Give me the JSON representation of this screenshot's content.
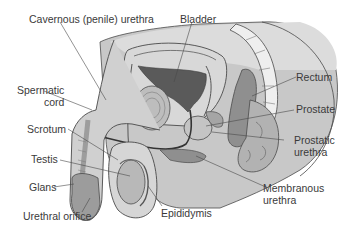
{
  "diagram": {
    "labels": {
      "cavernous_urethra": "Cavernous (penile) urethra",
      "bladder": "Bladder",
      "spermatic_cord_1": "Spermatic",
      "spermatic_cord_2": "cord",
      "rectum": "Rectum",
      "prostate": "Prostate",
      "scrotum": "Scrotum",
      "prostatic_urethra_1": "Prostatic",
      "prostatic_urethra_2": "urethra",
      "testis": "Testis",
      "glans": "Glans",
      "membranous_urethra_1": "Membranous",
      "membranous_urethra_2": "urethra",
      "urethral_orifice": "Urethral orifice",
      "epididymis": "Epididymis"
    },
    "colors": {
      "body_gray": "#c8c8c8",
      "light_gray": "#dedede",
      "mid_gray": "#a9a9a9",
      "dark_gray": "#5e5e5e",
      "outline": "#4a4a4a",
      "text": "#3a3a3a"
    }
  }
}
